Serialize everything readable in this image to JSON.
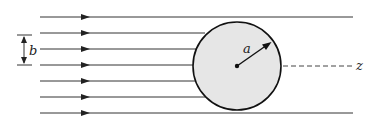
{
  "diagram": {
    "labels": {
      "impact_parameter": "b",
      "radius": "a",
      "axis": "z"
    },
    "colors": {
      "line": "#222222",
      "sphere_fill": "#e6e6e6",
      "sphere_stroke": "#111111",
      "background": "#ffffff"
    },
    "lines": {
      "count": 7,
      "y_positions": [
        17,
        33,
        49,
        65,
        81,
        97,
        113
      ],
      "x_start": 40,
      "arrow_x": 86,
      "full_length_end": 353
    },
    "sphere": {
      "cx": 237,
      "cy": 66,
      "r": 44
    },
    "impact_marker": {
      "x": 24,
      "y_top": 35,
      "y_bottom": 65
    },
    "axis": {
      "dashed_start": 283,
      "dashed_end": 352,
      "label_x": 357
    }
  }
}
